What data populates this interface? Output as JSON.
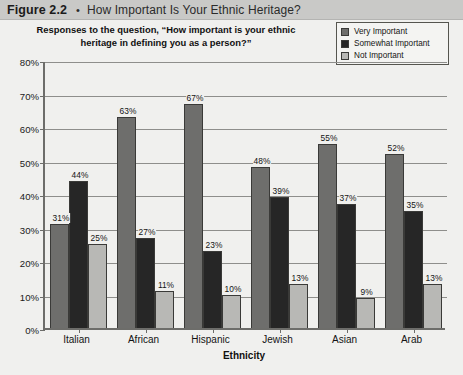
{
  "figure": {
    "label": "Figure 2.2",
    "bullet": "•",
    "title": "How Important Is Your Ethnic Heritage?"
  },
  "legend": {
    "items": [
      {
        "label": "Very Important",
        "color": "#6e6e6c"
      },
      {
        "label": "Somewhat Important",
        "color": "#262626"
      },
      {
        "label": "Not Important",
        "color": "#b8b8b5"
      }
    ]
  },
  "chart_data": {
    "type": "bar",
    "title": "Responses to the question, “How important is your ethnic heritage in defining you as a person?”",
    "xlabel": "Ethnicity",
    "ylabel": "",
    "ylim": [
      0,
      80
    ],
    "ytick_labels": [
      "0%",
      "10%",
      "20%",
      "30%",
      "40%",
      "50%",
      "60%",
      "70%",
      "80%"
    ],
    "ytick_values": [
      0,
      10,
      20,
      30,
      40,
      50,
      60,
      70,
      80
    ],
    "grid": true,
    "legend_position": "top-right",
    "categories": [
      "Italian",
      "African",
      "Hispanic",
      "Jewish",
      "Asian",
      "Arab"
    ],
    "series": [
      {
        "name": "Very Important",
        "color": "#6e6e6c",
        "values": [
          31,
          63,
          67,
          48,
          55,
          52
        ],
        "labels": [
          "31%",
          "63%",
          "67%",
          "48%",
          "55%",
          "52%"
        ]
      },
      {
        "name": "Somewhat Important",
        "color": "#262626",
        "values": [
          44,
          27,
          23,
          39,
          37,
          35
        ],
        "labels": [
          "44%",
          "27%",
          "23%",
          "39%",
          "37%",
          "35%"
        ]
      },
      {
        "name": "Not Important",
        "color": "#b8b8b5",
        "values": [
          25,
          11,
          10,
          13,
          9,
          13
        ],
        "labels": [
          "25%",
          "11%",
          "10%",
          "13%",
          "9%",
          "13%"
        ]
      }
    ]
  }
}
